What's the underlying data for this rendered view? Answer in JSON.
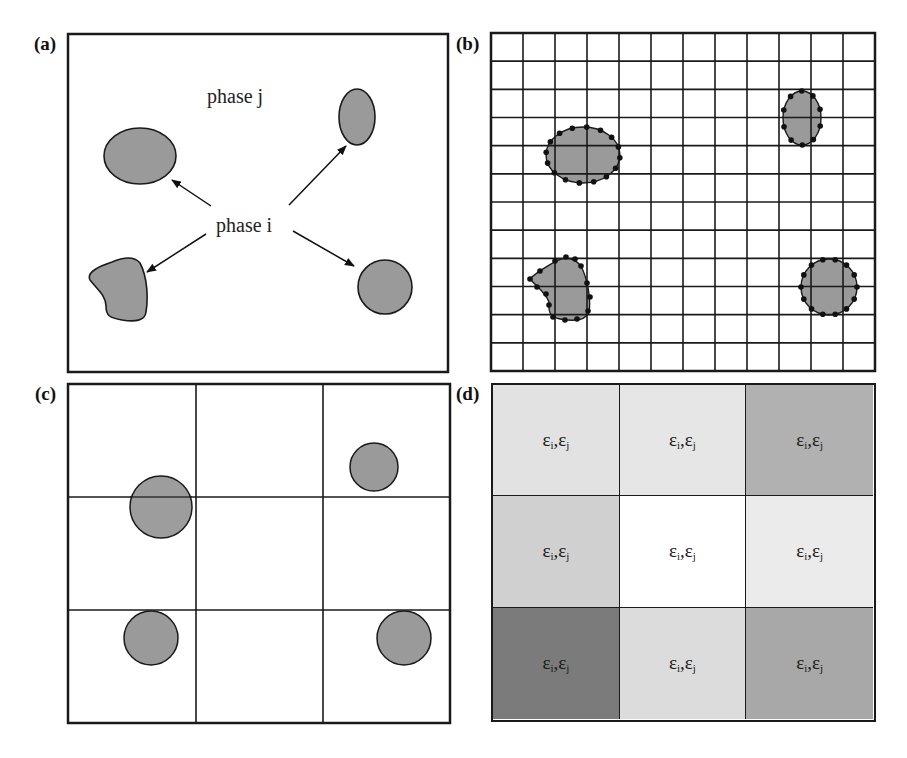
{
  "figure": {
    "panels": [
      {
        "id": "a",
        "label": "(a)",
        "description": "Continuous domain with phase i inclusions in phase j matrix"
      },
      {
        "id": "b",
        "label": "(b)",
        "description": "Fine 12x12 mesh with interface nodes on inclusion boundaries"
      },
      {
        "id": "c",
        "label": "(c)",
        "description": "Coarse 3x3 mesh over idealized circular inclusions"
      },
      {
        "id": "d",
        "label": "(d)",
        "description": "3x3 cells with homogenized phase fractions shown as gray levels"
      }
    ],
    "panel_a": {
      "matrix_label": "phase j",
      "inclusion_label": "phase i",
      "fill_color": "#9a9a9a",
      "stroke_color": "#1a1a1a"
    },
    "panel_b": {
      "grid_rows": 12,
      "grid_cols": 12,
      "node_color": "#111111"
    },
    "panel_c": {
      "grid_rows": 3,
      "grid_cols": 3
    },
    "panel_d": {
      "grid_rows": 3,
      "grid_cols": 3,
      "cell_symbol": "εi,εj",
      "eps": "ε",
      "sub_i": "i",
      "sub_j": "j",
      "separator": ",",
      "cells": [
        {
          "row": 0,
          "col": 0,
          "color": "#e2e2e2"
        },
        {
          "row": 0,
          "col": 1,
          "color": "#e6e6e6"
        },
        {
          "row": 0,
          "col": 2,
          "color": "#b1b1b1"
        },
        {
          "row": 1,
          "col": 0,
          "color": "#d0d0d0"
        },
        {
          "row": 1,
          "col": 1,
          "color": "#ffffff"
        },
        {
          "row": 1,
          "col": 2,
          "color": "#ebebeb"
        },
        {
          "row": 2,
          "col": 0,
          "color": "#7b7b7b"
        },
        {
          "row": 2,
          "col": 1,
          "color": "#dcdcdc"
        },
        {
          "row": 2,
          "col": 2,
          "color": "#a8a8a8"
        }
      ]
    }
  }
}
